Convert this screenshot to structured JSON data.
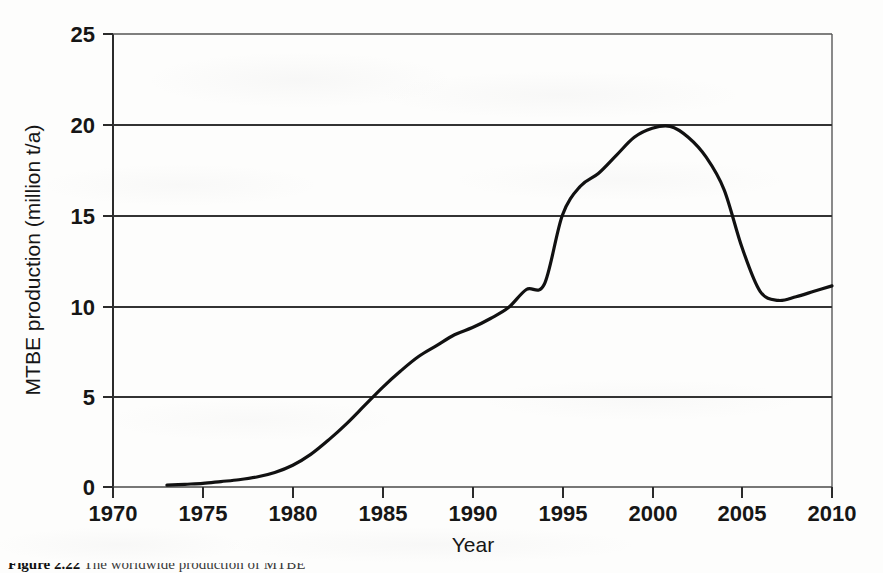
{
  "figure": {
    "background_color": "#fdfdfc",
    "line_color": "#111111",
    "axis_color": "#2b2b2b",
    "gridline_color": "#3a3a3a"
  },
  "caption": {
    "label": "Figure 2.22",
    "text": "The worldwide production of MTBE"
  },
  "chart_data": {
    "type": "line",
    "title": "",
    "xlabel": "Year",
    "ylabel": "MTBE production (million t/a)",
    "xlim": [
      1970,
      2010
    ],
    "ylim": [
      0,
      25
    ],
    "xticks": [
      1970,
      1975,
      1980,
      1985,
      1990,
      1995,
      2000,
      2005,
      2010
    ],
    "xtick_labels": [
      "1970",
      "1975",
      "1980",
      "1985",
      "1990",
      "1995",
      "2000",
      "2005",
      "2010"
    ],
    "yticks": [
      0,
      5,
      10,
      15,
      20,
      25
    ],
    "ytick_labels": [
      "0",
      "5",
      "10",
      "15",
      "20",
      "25"
    ],
    "grid": "horizontal",
    "legend": "none",
    "series": [
      {
        "name": "MTBE production",
        "x": [
          1973,
          1974,
          1975,
          1976,
          1977,
          1978,
          1979,
          1980,
          1981,
          1982,
          1983,
          1984,
          1985,
          1986,
          1987,
          1988,
          1989,
          1990,
          1991,
          1992,
          1993,
          1994,
          1995,
          1996,
          1997,
          1998,
          1999,
          2000,
          2001,
          2002,
          2003,
          2004,
          2005,
          2006,
          2007,
          2008,
          2009,
          2010
        ],
        "y": [
          0.1,
          0.15,
          0.2,
          0.3,
          0.4,
          0.55,
          0.8,
          1.2,
          1.8,
          2.6,
          3.5,
          4.5,
          5.5,
          6.4,
          7.2,
          7.8,
          8.4,
          8.8,
          9.3,
          9.9,
          10.9,
          11.2,
          15.0,
          16.6,
          17.3,
          18.3,
          19.3,
          19.8,
          19.9,
          19.3,
          18.2,
          16.4,
          13.2,
          10.8,
          10.3,
          10.5,
          10.8,
          11.1
        ]
      }
    ]
  }
}
